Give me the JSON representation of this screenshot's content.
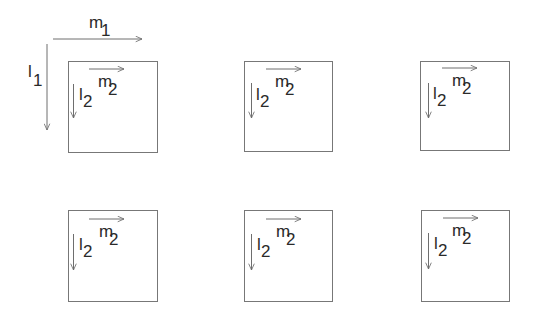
{
  "diagram": {
    "outer": {
      "m_label": "m",
      "m_sub": "1",
      "l_label": "l",
      "l_sub": "1"
    },
    "inner_labels": {
      "m_label": "m",
      "m_sub": "2",
      "l_label": "l",
      "l_sub": "2"
    },
    "grid": {
      "rows": 2,
      "cols": 3
    },
    "blocks": [
      {
        "row": 1,
        "col": 1,
        "m_label": "m",
        "m_sub": "2",
        "l_label": "l",
        "l_sub": "2"
      },
      {
        "row": 1,
        "col": 2,
        "m_label": "m",
        "m_sub": "2",
        "l_label": "l",
        "l_sub": "2"
      },
      {
        "row": 1,
        "col": 3,
        "m_label": "m",
        "m_sub": "2",
        "l_label": "l",
        "l_sub": "2"
      },
      {
        "row": 2,
        "col": 1,
        "m_label": "m",
        "m_sub": "2",
        "l_label": "l",
        "l_sub": "2"
      },
      {
        "row": 2,
        "col": 2,
        "m_label": "m",
        "m_sub": "2",
        "l_label": "l",
        "l_sub": "2"
      },
      {
        "row": 2,
        "col": 3,
        "m_label": "m",
        "m_sub": "2",
        "l_label": "l",
        "l_sub": "2"
      }
    ],
    "colors": {
      "line": "#6e6e6e",
      "text": "#2a2a2a",
      "background": "#ffffff"
    }
  }
}
